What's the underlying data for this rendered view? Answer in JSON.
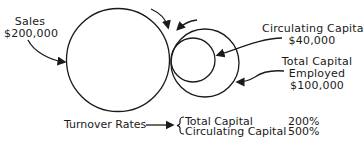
{
  "diagram": {
    "nodes": [
      {
        "id": "sales",
        "label": "Sales",
        "value": "$200,000",
        "shape": "circle",
        "size": "large"
      },
      {
        "id": "total_capital",
        "label": "Total Capital Employed",
        "value": "$100,000",
        "shape": "circle",
        "size": "medium"
      },
      {
        "id": "circulating_capital",
        "label": "Circulating Capital",
        "value": "$40,000",
        "shape": "circle",
        "size": "small"
      }
    ],
    "edges": [
      {
        "from": "total_capital",
        "to": "sales",
        "type": "rotation-arrow"
      },
      {
        "from": "circulating_capital",
        "to": "total_capital",
        "type": "rotation-arrow"
      }
    ]
  },
  "labels": {
    "sales": {
      "line1": "Sales",
      "line2": "$200,000"
    },
    "circulating": {
      "line1": "Circulating Capital",
      "line2": "$40,000"
    },
    "total": {
      "line1": "Total Capital",
      "line2": "Employed",
      "line3": "$100,000"
    }
  },
  "turnover": {
    "title": "Turnover Rates",
    "rows": [
      {
        "name": "Total Capital",
        "rate": "200%"
      },
      {
        "name": "Circulating Capital",
        "rate": "500%"
      }
    ]
  },
  "colors": {
    "ink": "#1a1a1a",
    "background": "#ffffff"
  }
}
